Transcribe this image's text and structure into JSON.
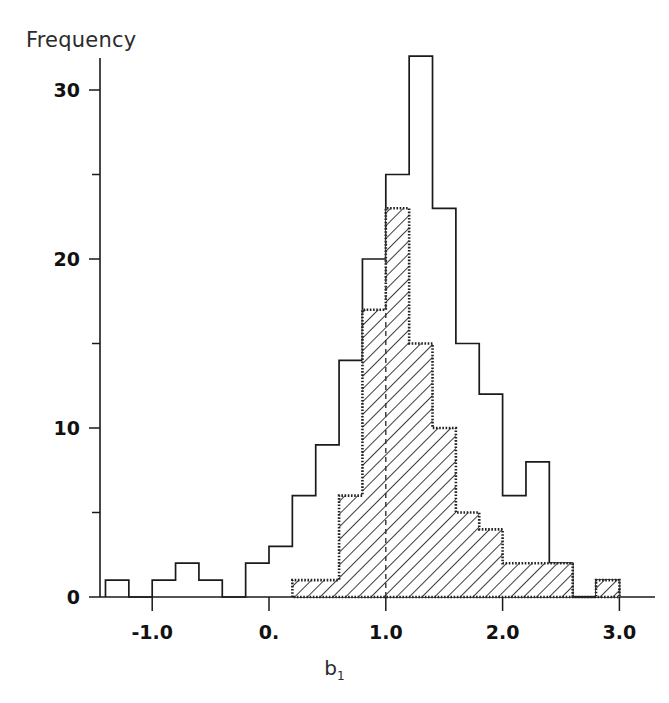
{
  "chart_data": {
    "type": "bar",
    "title": "",
    "subtitle": "",
    "xlabel": "b1",
    "xlabel_display": "b",
    "xlabel_subscript": "1",
    "ylabel": "Frequency",
    "xlim": [
      -1.45,
      3.15
    ],
    "ylim": [
      0,
      34
    ],
    "grid": false,
    "legend_position": "none",
    "bin_width": 0.2,
    "x_ticks": [
      -1.0,
      0.0,
      1.0,
      2.0,
      3.0
    ],
    "x_tick_labels": [
      "-1.0",
      "0.",
      "1.0",
      "2.0",
      "3.0"
    ],
    "y_ticks": [
      0,
      10,
      20,
      30
    ],
    "y_tick_labels": [
      "0",
      "10",
      "20",
      "30"
    ],
    "y_minor_ticks": [
      5,
      15,
      25
    ],
    "bin_left_edges": [
      -1.4,
      -1.2,
      -1.0,
      -0.8,
      -0.6,
      -0.4,
      -0.2,
      0.0,
      0.2,
      0.4,
      0.6,
      0.8,
      1.0,
      1.2,
      1.4,
      1.6,
      1.8,
      2.0,
      2.2,
      2.4,
      2.6,
      2.8
    ],
    "series": [
      {
        "name": "all-samples-outline",
        "style": "open-outline",
        "values": [
          1,
          0,
          1,
          2,
          1,
          0,
          2,
          3,
          6,
          9,
          14,
          20,
          25,
          32,
          23,
          15,
          12,
          6,
          8,
          2,
          0,
          1
        ]
      },
      {
        "name": "subset-hatched",
        "style": "diagonal-hatch",
        "values": [
          0,
          0,
          0,
          0,
          0,
          0,
          0,
          0,
          1,
          1,
          6,
          17,
          23,
          15,
          10,
          5,
          4,
          2,
          2,
          2,
          0,
          1
        ]
      }
    ],
    "annotations": [
      {
        "name": "median-marker",
        "type": "vertical-dashed-line",
        "x": 1.0,
        "y_from": 0,
        "y_to": 23
      }
    ],
    "colors": {
      "axis": "#1a1a1a",
      "outline_stroke": "#1a1a1a",
      "hatch_stroke": "#222222",
      "background": "#ffffff"
    }
  }
}
